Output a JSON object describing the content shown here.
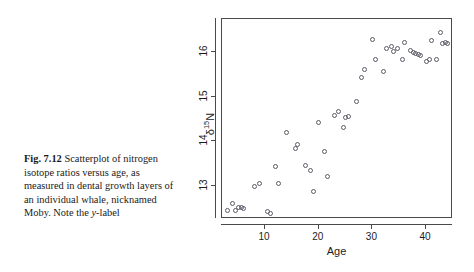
{
  "caption": {
    "figure_number": "Fig. 7.12",
    "text_part1": "Scatterplot of nitrogen isotope ratios versus age, as measured in dental growth layers of an individual whale, nicknamed Moby. Note the ",
    "italic_token": "y",
    "text_part2": "-label",
    "full_text": "Fig. 7.12 Scatterplot of nitrogen isotope ratios versus age, as measured in dental growth layers of an individual whale, nicknamed Moby. Note the y-label"
  },
  "chart_data": {
    "type": "scatter",
    "title": "",
    "xlabel": "Age",
    "ylabel_plain": "d15N",
    "ylabel_symbol": "δ",
    "ylabel_superscript": "15",
    "ylabel_element": "N",
    "xlim": [
      2.0,
      45.0
    ],
    "ylim": [
      12.25,
      16.75
    ],
    "xticks": [
      10,
      20,
      30,
      40
    ],
    "xtick_labels": [
      "10",
      "20",
      "30",
      "40"
    ],
    "yticks": [
      13,
      14,
      15,
      16
    ],
    "ytick_labels": [
      "13",
      "14",
      "15",
      "16"
    ],
    "grid": false,
    "legend": false,
    "marker": "open-circle",
    "marker_color": "#5a5a66",
    "frame": true,
    "n_points": 52,
    "x": [
      3,
      4,
      4.6,
      5,
      5.6,
      6,
      6.6,
      8,
      9,
      10.5,
      11,
      12,
      12.6,
      14,
      15.6,
      16,
      17.6,
      18.4,
      19,
      20,
      21,
      21.6,
      23,
      23.6,
      24.6,
      25,
      25.6,
      27,
      28,
      28.6,
      30,
      30.6,
      32,
      32.6,
      33.6,
      34,
      34.6,
      35.6,
      36,
      37,
      37.6,
      38,
      38.6,
      39,
      40,
      40.6,
      41,
      42,
      42.6,
      43,
      43.6,
      44
    ],
    "y": [
      12.45,
      12.6,
      12.45,
      12.52,
      12.5,
      12.48,
      12.24,
      12.99,
      13.05,
      12.42,
      12.38,
      13.44,
      13.05,
      14.19,
      13.83,
      13.93,
      13.45,
      13.35,
      12.88,
      14.42,
      13.76,
      13.21,
      14.57,
      14.67,
      14.32,
      14.53,
      14.55,
      14.89,
      15.43,
      15.62,
      16.28,
      15.85,
      15.56,
      16.08,
      16.13,
      16.02,
      16.08,
      15.85,
      16.22,
      16.05,
      15.99,
      15.97,
      15.95,
      15.93,
      15.79,
      15.83,
      16.27,
      15.84,
      16.45,
      16.2,
      16.22,
      16.19
    ]
  }
}
